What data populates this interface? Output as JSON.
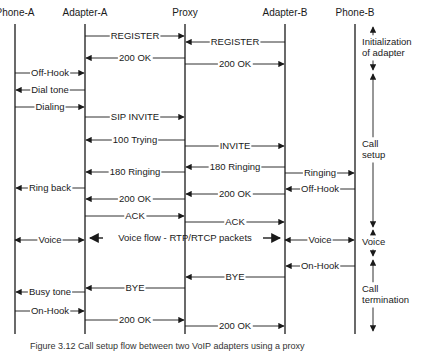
{
  "diagram": {
    "type": "sequence",
    "participants": [
      {
        "id": "phoneA",
        "label": "Phone-A",
        "x": 15
      },
      {
        "id": "adapterA",
        "label": "Adapter-A",
        "x": 85
      },
      {
        "id": "proxy",
        "label": "Proxy",
        "x": 185
      },
      {
        "id": "adapterB",
        "label": "Adapter-B",
        "x": 285
      },
      {
        "id": "phoneB",
        "label": "Phone-B",
        "x": 355
      }
    ],
    "messages": [
      {
        "label": "REGISTER",
        "from": "adapterA",
        "to": "proxy",
        "y": 36
      },
      {
        "label": "REGISTER",
        "from": "adapterB",
        "to": "proxy",
        "y": 42
      },
      {
        "label": "200 OK",
        "from": "proxy",
        "to": "adapterA",
        "y": 58
      },
      {
        "label": "200 OK",
        "from": "proxy",
        "to": "adapterB",
        "y": 64
      },
      {
        "label": "Off-Hook",
        "from": "phoneA",
        "to": "adapterA",
        "y": 73
      },
      {
        "label": "Dial tone",
        "from": "adapterA",
        "to": "phoneA",
        "y": 90
      },
      {
        "label": "Dialing",
        "from": "phoneA",
        "to": "adapterA",
        "y": 107
      },
      {
        "label": "SIP INVITE",
        "from": "adapterA",
        "to": "proxy",
        "y": 117
      },
      {
        "label": "100 Trying",
        "from": "proxy",
        "to": "adapterA",
        "y": 140
      },
      {
        "label": "INVITE",
        "from": "proxy",
        "to": "adapterB",
        "y": 146
      },
      {
        "label": "180 Ringing",
        "from": "adapterB",
        "to": "proxy",
        "y": 167
      },
      {
        "label": "180 Ringing",
        "from": "proxy",
        "to": "adapterA",
        "y": 172
      },
      {
        "label": "Ringing",
        "from": "adapterB",
        "to": "phoneB",
        "y": 173
      },
      {
        "label": "Ring back",
        "from": "adapterA",
        "to": "phoneA",
        "y": 188
      },
      {
        "label": "Off-Hook",
        "from": "phoneB",
        "to": "adapterB",
        "y": 189
      },
      {
        "label": "200 OK",
        "from": "adapterB",
        "to": "proxy",
        "y": 194
      },
      {
        "label": "200 OK",
        "from": "proxy",
        "to": "adapterA",
        "y": 199
      },
      {
        "label": "ACK",
        "from": "adapterA",
        "to": "proxy",
        "y": 216
      },
      {
        "label": "ACK",
        "from": "proxy",
        "to": "adapterB",
        "y": 222
      },
      {
        "label": "Voice",
        "from": "phoneA",
        "to": "adapterA",
        "y": 240,
        "bidirectional": true
      },
      {
        "label": "Voice flow - RTP/RTCP packets",
        "from": "adapterA",
        "to": "adapterB",
        "y": 238,
        "bidirectional": true,
        "free_arrows": true
      },
      {
        "label": "Voice",
        "from": "adapterB",
        "to": "phoneB",
        "y": 240,
        "bidirectional": true
      },
      {
        "label": "On-Hook",
        "from": "phoneB",
        "to": "adapterB",
        "y": 266
      },
      {
        "label": "BYE",
        "from": "adapterB",
        "to": "proxy",
        "y": 277
      },
      {
        "label": "BYE",
        "from": "proxy",
        "to": "adapterA",
        "y": 288
      },
      {
        "label": "Busy tone",
        "from": "adapterA",
        "to": "phoneA",
        "y": 292
      },
      {
        "label": "On-Hook",
        "from": "phoneA",
        "to": "adapterA",
        "y": 311
      },
      {
        "label": "200 OK",
        "from": "adapterA",
        "to": "proxy",
        "y": 320
      },
      {
        "label": "200 OK",
        "from": "proxy",
        "to": "adapterB",
        "y": 326
      }
    ],
    "phases": [
      {
        "label_lines": [
          "Initialization",
          "of adapter"
        ],
        "y_start": 27,
        "y_end": 70
      },
      {
        "label_lines": [
          "Call",
          "setup"
        ],
        "y_start": 74,
        "y_end": 227
      },
      {
        "label_lines": [
          "Voice"
        ],
        "y_start": 230,
        "y_end": 256
      },
      {
        "label_lines": [
          "Call",
          "termination"
        ],
        "y_start": 260,
        "y_end": 331
      }
    ],
    "caption": "Figure 3.12  Call setup flow between two VoIP adapters using a proxy"
  }
}
